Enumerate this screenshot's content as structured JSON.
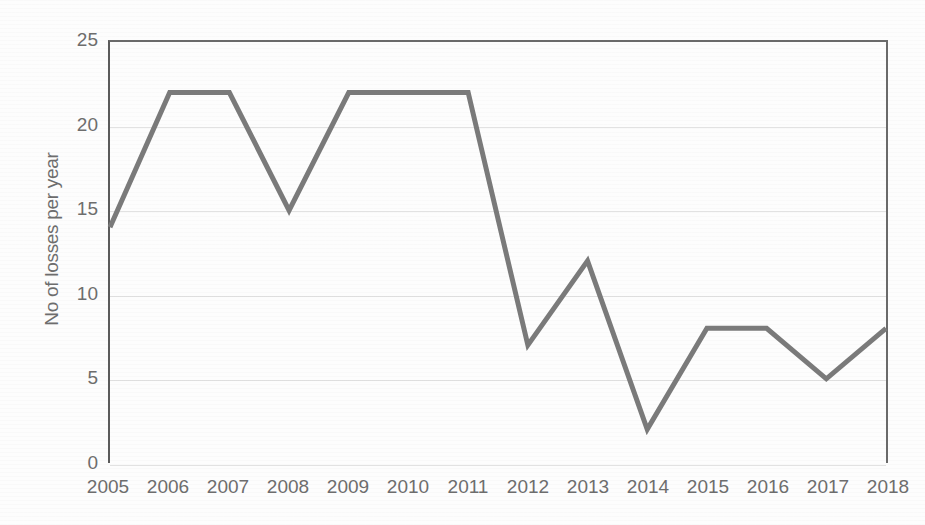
{
  "chart_data": {
    "type": "line",
    "title": "",
    "xlabel": "",
    "ylabel": "No of losses per year",
    "categories": [
      "2005",
      "2006",
      "2007",
      "2008",
      "2009",
      "2010",
      "2011",
      "2012",
      "2013",
      "2014",
      "2015",
      "2016",
      "2017",
      "2018"
    ],
    "values": [
      14,
      22,
      22,
      15,
      22,
      22,
      22,
      7,
      12,
      2,
      8,
      8,
      5,
      8
    ],
    "series": [
      {
        "name": "No of losses per year",
        "values": [
          14,
          22,
          22,
          15,
          22,
          22,
          22,
          7,
          12,
          2,
          8,
          8,
          5,
          8
        ]
      }
    ],
    "ylim": [
      0,
      25
    ],
    "yticks": [
      0,
      5,
      10,
      15,
      20,
      25
    ],
    "ytick_labels": [
      "0",
      "5",
      "10",
      "15",
      "20",
      "25"
    ],
    "grid": true,
    "grid_axis": "y",
    "legend": false,
    "legend_position": "none",
    "line_color": "#7a7a7a",
    "line_width": 5,
    "markers": false,
    "axis_color": "#6a6a6a",
    "grid_color": "#e2e2e2",
    "tick_label_color": "#6d6d6d",
    "background_color": "#ffffff"
  }
}
